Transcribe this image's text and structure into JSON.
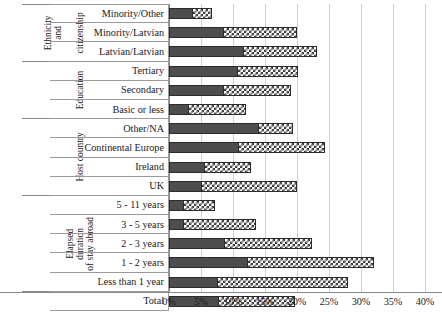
{
  "chart_data": {
    "type": "bar",
    "orientation": "horizontal",
    "stacked": true,
    "title": "",
    "xlabel": "",
    "ylabel": "",
    "xlim": [
      0,
      40
    ],
    "xunit": "%",
    "xticks": [
      "0%",
      "5%",
      "10%",
      "15%",
      "20%",
      "25%",
      "30%",
      "35%",
      "40%"
    ],
    "xtick_values": [
      0,
      5,
      10,
      15,
      20,
      25,
      30,
      35,
      40
    ],
    "grid": true,
    "legend": "none",
    "series": [
      {
        "name": "dark-segment",
        "color": "#4d4d4d",
        "pattern": "solid"
      },
      {
        "name": "hatched-segment",
        "color": "#ffffff",
        "pattern": "checkered"
      }
    ],
    "categories": [
      "Minority/Other",
      "Minority/Latvian",
      "Latvian/Latvian",
      "Tertiary",
      "Secondary",
      "Basic or less",
      "Other/NA",
      "Continental Europe",
      "Ireland",
      "UK",
      "5 - 11 years",
      "3 - 5 years",
      "2 - 3 years",
      "1 - 2 years",
      "Less than 1 year",
      "Total"
    ],
    "rows": [
      {
        "category": "Minority/Other",
        "dark": 3.8,
        "hatch": 3.0,
        "total": 6.8
      },
      {
        "category": "Minority/Latvian",
        "dark": 8.6,
        "hatch": 11.5,
        "total": 20.1
      },
      {
        "category": "Latvian/Latvian",
        "dark": 11.7,
        "hatch": 11.6,
        "total": 23.3
      },
      {
        "category": "Tertiary",
        "dark": 10.8,
        "hatch": 9.5,
        "total": 20.3
      },
      {
        "category": "Secondary",
        "dark": 8.6,
        "hatch": 10.6,
        "total": 19.2
      },
      {
        "category": "Basic or less",
        "dark": 3.1,
        "hatch": 9.1,
        "total": 12.2
      },
      {
        "category": "Other/NA",
        "dark": 14.1,
        "hatch": 5.4,
        "total": 19.5
      },
      {
        "category": "Continental Europe",
        "dark": 11.0,
        "hatch": 13.6,
        "total": 24.6
      },
      {
        "category": "Ireland",
        "dark": 5.6,
        "hatch": 7.3,
        "total": 12.9
      },
      {
        "category": "UK",
        "dark": 5.2,
        "hatch": 15.0,
        "total": 20.2
      },
      {
        "category": "5 - 11 years",
        "dark": 2.4,
        "hatch": 5.0,
        "total": 7.4
      },
      {
        "category": "3 - 5 years",
        "dark": 2.4,
        "hatch": 11.4,
        "total": 13.8
      },
      {
        "category": "2 - 3 years",
        "dark": 8.8,
        "hatch": 13.7,
        "total": 22.5
      },
      {
        "category": "1 - 2 years",
        "dark": 12.4,
        "hatch": 19.8,
        "total": 32.2
      },
      {
        "category": "Less than 1 year",
        "dark": 7.6,
        "hatch": 20.5,
        "total": 28.1
      },
      {
        "category": "Total",
        "dark": 7.8,
        "hatch": 12.0,
        "total": 19.8
      }
    ]
  },
  "groups_outer": [
    {
      "label": "Ethnicity\nand",
      "rows": 3
    },
    {
      "label": "",
      "rows": 3
    },
    {
      "label": "",
      "rows": 4
    },
    {
      "label": "",
      "rows": 5
    },
    {
      "label": "",
      "rows": 1
    }
  ],
  "groups_inner": [
    {
      "label": "citizenship",
      "rows": 3
    },
    {
      "label": "Education",
      "rows": 3
    },
    {
      "label": "Host country",
      "rows": 4
    },
    {
      "label": "Elapsed duration\nof stay abroad",
      "rows": 5
    },
    {
      "label": "",
      "rows": 1
    }
  ]
}
